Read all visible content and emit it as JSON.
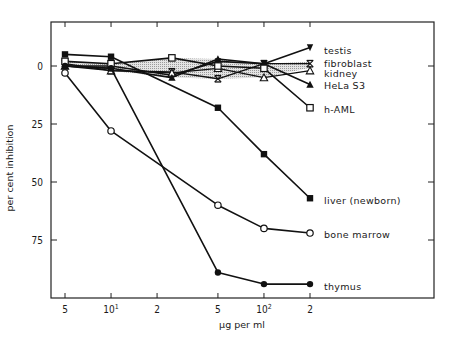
{
  "chart_data": {
    "type": "line",
    "title": "",
    "xlabel": "µg per ml",
    "ylabel": "per cent inhibition",
    "x_scale": "log",
    "x": [
      5,
      10,
      25,
      50,
      100,
      200
    ],
    "x_tick_labels": [
      "5",
      "10¹",
      "2",
      "5",
      "10²",
      "2"
    ],
    "x_tick_values": [
      5,
      10,
      20,
      50,
      100,
      200
    ],
    "y_tick_labels": [
      "0",
      "25",
      "50",
      "75"
    ],
    "y_tick_values": [
      0,
      25,
      50,
      75
    ],
    "ylim": [
      -10,
      100
    ],
    "y_inverted": true,
    "grid": false,
    "legend_position": "right, labels at line ends",
    "shaded_band": {
      "description": "stippled gray band around 0% between fibroblast/kidney/HeLa lines",
      "color": "#cfcfcf"
    },
    "series": [
      {
        "name": "testis",
        "marker": "filled-triangle-down",
        "x": [
          5,
          10,
          25,
          50,
          100,
          200
        ],
        "values": [
          0,
          0,
          4,
          -2,
          -1,
          -8
        ]
      },
      {
        "name": "fibroblast",
        "marker": "x-cross",
        "x": [
          5,
          10,
          25,
          50,
          100,
          200
        ],
        "values": [
          -1,
          2,
          2.5,
          5.5,
          -1,
          -1
        ]
      },
      {
        "name": "kidney",
        "marker": "open-triangle",
        "x": [
          5,
          10,
          25,
          50,
          100,
          200
        ],
        "values": [
          0,
          2,
          3,
          1,
          5,
          2
        ]
      },
      {
        "name": "HeLa S3",
        "marker": "filled-triangle",
        "x": [
          5,
          10,
          25,
          50,
          100,
          200
        ],
        "values": [
          0,
          1,
          5,
          -3,
          -1,
          8
        ]
      },
      {
        "name": "h-AML",
        "marker": "open-square",
        "x": [
          5,
          10,
          25,
          50,
          100,
          200
        ],
        "values": [
          -2,
          -1,
          -3.5,
          0,
          1,
          18
        ]
      },
      {
        "name": "liver (newborn)",
        "marker": "filled-square",
        "x": [
          5,
          10,
          50,
          100,
          200
        ],
        "values": [
          -5,
          -4,
          18,
          38,
          57
        ]
      },
      {
        "name": "bone marrow",
        "marker": "open-circle",
        "x": [
          5,
          10,
          50,
          100,
          200
        ],
        "values": [
          3,
          28,
          60,
          70,
          72
        ]
      },
      {
        "name": "thymus",
        "marker": "filled-circle",
        "x": [
          5,
          10,
          50,
          100,
          200
        ],
        "values": [
          0,
          1,
          89,
          94,
          94
        ]
      }
    ]
  }
}
